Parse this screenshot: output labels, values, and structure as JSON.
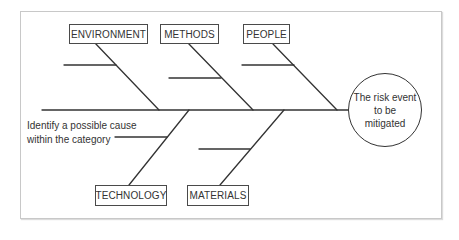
{
  "diagram": {
    "type": "fishbone",
    "effect": {
      "lines": [
        "The risk event",
        "to be",
        "mitigated"
      ]
    },
    "categories": {
      "top": [
        {
          "label": "ENVIRONMENT"
        },
        {
          "label": "METHODS"
        },
        {
          "label": "PEOPLE"
        }
      ],
      "bottom": [
        {
          "label": "TECHNOLOGY"
        },
        {
          "label": "MATERIALS"
        }
      ]
    },
    "annotation": {
      "lines": [
        "Identify a possible cause",
        "within the category"
      ]
    },
    "colors": {
      "line": "#333333",
      "frame": "#c8c8c8",
      "text": "#333333"
    }
  }
}
